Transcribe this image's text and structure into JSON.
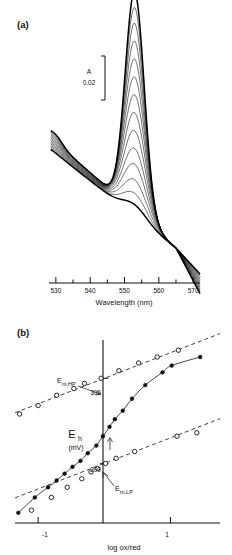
{
  "figure": {
    "background_color": "#ffffff",
    "ink_color": "#111111",
    "panels": [
      {
        "id": "a",
        "label": "(a)"
      },
      {
        "id": "b",
        "label": "(b)"
      }
    ]
  },
  "panel_a": {
    "label": "(a)",
    "xlabel": "Wavelength   (nm)",
    "scalebar": {
      "symbol": "A",
      "value": "0.02"
    },
    "chart_data": {
      "type": "line",
      "title": "(a)",
      "xlabel": "Wavelength (nm)",
      "ylabel": "A",
      "xlim": [
        528,
        572
      ],
      "ylim": [
        0,
        0.14
      ],
      "grid": false,
      "legend_position": "none",
      "scalebar_value": 0.02,
      "tick_labels": [
        "530",
        "540",
        "550",
        "560",
        "570"
      ],
      "major_ticks": [
        530,
        540,
        550,
        560,
        570
      ],
      "minor_ticks": [
        535,
        545,
        555,
        565
      ],
      "peak_nm": 553,
      "isosbestic_nm": 565,
      "n_traces": 14,
      "series_amplitudes": [
        1.0,
        0.93,
        0.86,
        0.78,
        0.7,
        0.62,
        0.54,
        0.46,
        0.38,
        0.3,
        0.23,
        0.16,
        0.1,
        0.05
      ],
      "description": "Reductive titration difference spectra with an alpha-band peak near 553 nm and an isosbestic crossing near 565 nm"
    }
  },
  "panel_b": {
    "label": "(b)",
    "xlabel": "log ox/red",
    "ylabel_line1": "E",
    "ylabel_sub": "h",
    "ylabel_line2": "(mV)",
    "annotations": [
      {
        "name": "em-hp",
        "text": "E",
        "sub": "m,HP"
      },
      {
        "name": "em-lp",
        "text": "E",
        "sub": "m,LP"
      }
    ],
    "y_tick_labels": [
      "300",
      "200"
    ],
    "x_tick_labels": [
      "-1",
      "1"
    ],
    "chart_data": {
      "type": "scatter",
      "title": "(b)",
      "xlabel": "log ox/red",
      "ylabel": "Eh (mV)",
      "xlim": [
        -1.35,
        1.75
      ],
      "ylim": [
        130,
        345
      ],
      "grid": false,
      "legend_position": "none",
      "x_major_ticks": [
        -1,
        0,
        1
      ],
      "x_tick_labels": [
        "-1",
        "",
        "1"
      ],
      "y_major_ticks": [
        200,
        300
      ],
      "y_tick_labels": [
        "200",
        "300"
      ],
      "em_hp_mV": 300,
      "em_lp_mV": 200,
      "series": [
        {
          "name": "observed titration (filled circles)",
          "marker": "filled-circle",
          "line": "solid",
          "points": [
            [
              -1.3,
              142
            ],
            [
              -1.05,
              160
            ],
            [
              -0.85,
              172
            ],
            [
              -0.72,
              180
            ],
            [
              -0.6,
              188
            ],
            [
              -0.48,
              196
            ],
            [
              -0.36,
              203
            ],
            [
              -0.25,
              212
            ],
            [
              -0.12,
              221
            ],
            [
              -0.02,
              232
            ],
            [
              0.08,
              243
            ],
            [
              0.16,
              252
            ],
            [
              0.28,
              262
            ],
            [
              0.42,
              276
            ],
            [
              0.62,
              292
            ],
            [
              0.88,
              307
            ],
            [
              1.02,
              315
            ],
            [
              1.45,
              325
            ]
          ]
        },
        {
          "name": "high-potential component (open circles, upper dashed)",
          "marker": "open-circle",
          "line": "dashed",
          "points": [
            [
              -1.28,
              258
            ],
            [
              -1.0,
              268
            ],
            [
              -0.72,
              280
            ],
            [
              -0.46,
              288
            ],
            [
              -0.3,
              294
            ],
            [
              -0.05,
              300
            ],
            [
              0.22,
              309
            ],
            [
              0.52,
              318
            ],
            [
              0.8,
              325
            ],
            [
              1.12,
              333
            ]
          ]
        },
        {
          "name": "low-potential component (open circles, lower dashed)",
          "marker": "open-circle",
          "line": "dashed",
          "points": [
            [
              -1.1,
              145
            ],
            [
              -0.8,
              160
            ],
            [
              -0.56,
              172
            ],
            [
              -0.34,
              182
            ],
            [
              -0.2,
              190
            ],
            [
              -0.1,
              194
            ],
            [
              0.02,
              200
            ],
            [
              0.18,
              206
            ],
            [
              0.46,
              214
            ],
            [
              1.1,
              232
            ],
            [
              1.4,
              236
            ]
          ]
        }
      ],
      "fit_lines": [
        {
          "name": "upper-dashed-nernst",
          "slope_mV_per_decade": 30,
          "intercept_mV": 300
        },
        {
          "name": "lower-dashed-nernst",
          "slope_mV_per_decade": 30,
          "intercept_mV": 200
        }
      ]
    }
  }
}
